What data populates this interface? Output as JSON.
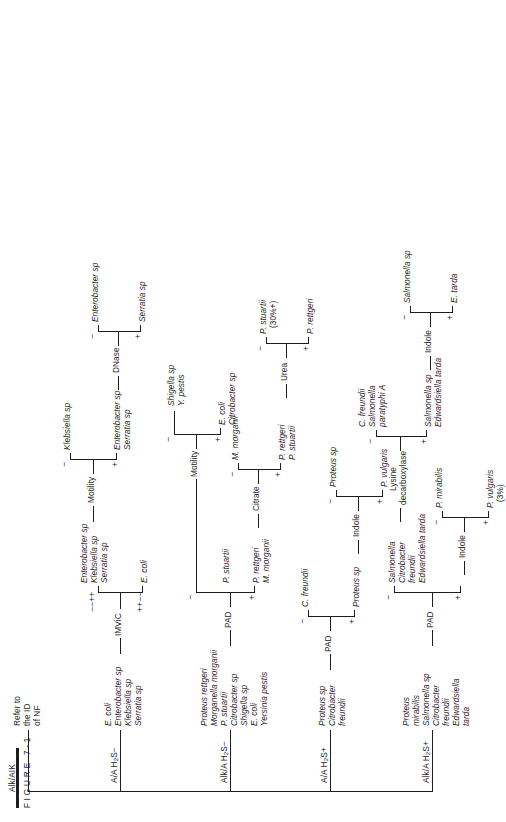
{
  "figure": {
    "caption": "FIGURE 7-1"
  },
  "root": {
    "label": "TSI reaction"
  },
  "branches": [
    {
      "id": "alk-alk",
      "header": "Alk/AIK",
      "result": [
        "Refer to",
        "the ID",
        "of NF"
      ]
    },
    {
      "id": "aa-h2s-neg",
      "header_pre": "A/A H",
      "header_sub": "2",
      "header_post": "S−",
      "organisms": [
        "E. coli",
        "Enterobacter sp",
        "Klebsiella sp",
        "Serratia sp"
      ],
      "tests": [
        {
          "name": "IMViC",
          "plus_label": "++−−",
          "minus_label": "−−++",
          "plus_organisms": [
            "E. coli"
          ],
          "minus_organisms": [
            "Enterobacter sp",
            "Klebsiella sp",
            "Serratia sp"
          ]
        },
        {
          "name": "Motility",
          "plus_label": "+",
          "minus_label": "−",
          "plus_organisms": [
            "Enterobacter sp",
            "Serratia sp"
          ],
          "minus_organisms": [
            "Klebsiella sp"
          ]
        },
        {
          "name": "DNase",
          "plus_label": "+",
          "minus_label": "−",
          "plus_organisms": [
            "Serratia sp"
          ],
          "minus_organisms": [
            "Enterobacter sp"
          ]
        }
      ]
    },
    {
      "id": "alka-h2s-neg",
      "header_pre": "Alk/A H",
      "header_sub": "2",
      "header_post": "S−",
      "organisms": [
        "Proteus rettgeri",
        "Morganella morganii",
        "P. stuartii",
        "Citrobacter sp",
        "Shigella sp",
        "E. coli",
        "Yersinia pestis"
      ],
      "tests": [
        {
          "name": "PAD",
          "plus_label": "+",
          "minus_label": "−",
          "plus_organisms": [
            "P. rettgeri",
            "M. morganii",
            "P. stuartii"
          ]
        },
        {
          "name": "Citrate",
          "plus_label": "+",
          "minus_label": "−",
          "plus_organisms": [
            "P. rettgeri",
            "P. stuartii"
          ],
          "minus_organisms": [
            "M. morganii"
          ]
        },
        {
          "name": "Urea",
          "plus_label": "+",
          "minus_label": "−",
          "plus_organisms": [
            "P. rettgeri"
          ],
          "minus_organisms": [
            "P. stuartii",
            "(30%+)"
          ]
        },
        {
          "name": "Motility",
          "plus_label": "+",
          "minus_label": "−",
          "plus_organisms": [
            "E. coli",
            "Citrobacter sp"
          ],
          "minus_organisms": [
            "Shigella sp",
            "Y. pestis"
          ]
        }
      ]
    },
    {
      "id": "aa-h2s-pos",
      "header_pre": "A/A H",
      "header_sub": "2",
      "header_post": "S+",
      "organisms": [
        "Proteus sp",
        "Citrobacter",
        "freundii"
      ],
      "tests": [
        {
          "name": "PAD",
          "plus_label": "+",
          "minus_label": "−",
          "plus_organisms": [
            "Proteus sp"
          ],
          "minus_organisms": [
            "C. freundii"
          ]
        },
        {
          "name": "Indole",
          "plus_label": "+",
          "minus_label": "−",
          "plus_organisms": [
            "P. vulgaris"
          ],
          "minus_organisms": [
            "Proteus sp"
          ]
        }
      ]
    },
    {
      "id": "alka-h2s-pos",
      "header_pre": "Alk/A H",
      "header_sub": "2",
      "header_post": "S+",
      "organisms": [
        "Proteus",
        "mirabilis",
        "Salmonella sp",
        "Citrobacter",
        "freundii",
        "Edwardsiella",
        "tarda"
      ],
      "tests": [
        {
          "name": "PAD",
          "plus_label": "+",
          "minus_label": "−",
          "minus_organisms": [
            "Salmonella",
            "Citrobacter",
            "freundii",
            "Edwardsiella tarda"
          ]
        },
        {
          "name": "Indole",
          "plus_label": "+",
          "minus_label": "−",
          "plus_organisms": [
            "P. vulgaris",
            "(3%)"
          ],
          "minus_organisms": [
            "P. mirabilis"
          ]
        },
        {
          "name": "Lysine decarboxylase",
          "name_line1": "Lysine",
          "name_line2": "decarboxylase",
          "plus_label": "+",
          "minus_label": "−",
          "plus_organisms": [
            "Salmonella sp",
            "Edwardsiella tarda"
          ],
          "minus_organisms": [
            "C. freundii",
            "Salmonella",
            "paratyphi A"
          ]
        },
        {
          "name": "Indole",
          "plus_label": "+",
          "minus_label": "−",
          "plus_organisms": [
            "E. tarda"
          ],
          "minus_organisms": [
            "Salmonella sp"
          ]
        }
      ]
    }
  ],
  "style": {
    "line_color": "#1d1d1d",
    "background": "#ffffff",
    "text_color": "#1d1d1d"
  }
}
